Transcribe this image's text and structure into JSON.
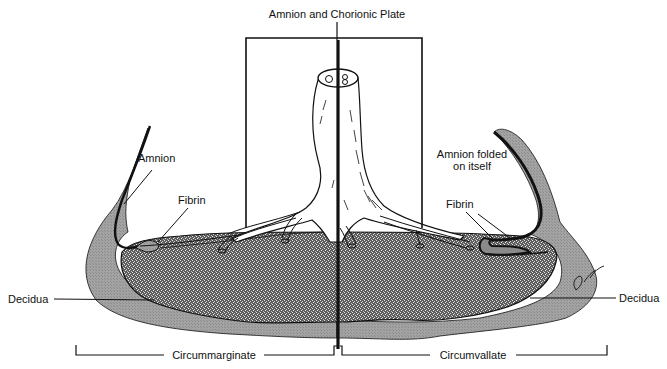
{
  "diagram": {
    "title_label": "Amnion and Chorionic Plate",
    "labels": {
      "amnion": "Amnion",
      "fibrin_left": "Fibrin",
      "amnion_folded_line1": "Amnion folded",
      "amnion_folded_line2": "on itself",
      "fibrin_right": "Fibrin",
      "decidua_left": "Decidua",
      "decidua_right": "Decidua",
      "circummarginate": "Circummarginate",
      "circumvallate": "Circumvallate"
    },
    "signature": "D.Spin",
    "colors": {
      "line": "#111111",
      "decidua_fill": "#9a9a9a",
      "placenta_fill": "#6e6e6e",
      "fibrin_fill": "#8a8a8a",
      "background": "#ffffff"
    }
  }
}
